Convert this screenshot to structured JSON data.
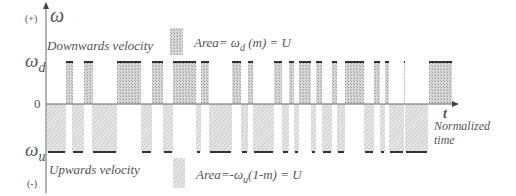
{
  "axis": {
    "y_symbol": "ω",
    "plus_label": "(+)",
    "minus_label": "(-)",
    "zero_label": "0",
    "omega_d_label": "ω",
    "omega_d_sub": "d",
    "omega_u_label": "ω",
    "omega_u_sub": "u",
    "t_label": "t",
    "x_label_line1": "Normalized",
    "x_label_line2": "time"
  },
  "labels": {
    "downwards": "Downwards velocity",
    "upwards": "Upwards velocity"
  },
  "legend": {
    "down_text": "Area=  ω",
    "down_sub": "d",
    "down_tail": " (m) = U",
    "up_text": "Area=-ω",
    "up_sub": "u",
    "up_tail": "(1-m) = U"
  },
  "colors": {
    "up_fill": "#c9c9c9",
    "down_fill": "#dcdcdc",
    "level_line": "#333333",
    "axis": "#555555"
  },
  "pulses": {
    "positive": [
      [
        66,
        73
      ],
      [
        84,
        93
      ],
      [
        117,
        141
      ],
      [
        152,
        163
      ],
      [
        173,
        196
      ],
      [
        201,
        209
      ],
      [
        232,
        241
      ],
      [
        248,
        253
      ],
      [
        274,
        282
      ],
      [
        289,
        294
      ],
      [
        299,
        311
      ],
      [
        316,
        322
      ],
      [
        332,
        337
      ],
      [
        345,
        364
      ],
      [
        374,
        380
      ],
      [
        385,
        389
      ],
      [
        404,
        405
      ],
      [
        429,
        452
      ]
    ],
    "negative": [
      [
        47,
        66
      ],
      [
        72,
        84
      ],
      [
        92,
        117
      ],
      [
        141,
        152
      ],
      [
        163,
        173
      ],
      [
        196,
        201
      ],
      [
        209,
        232
      ],
      [
        241,
        248
      ],
      [
        253,
        274
      ],
      [
        282,
        289
      ],
      [
        294,
        299
      ],
      [
        311,
        316
      ],
      [
        322,
        332
      ],
      [
        337,
        345
      ],
      [
        364,
        374
      ],
      [
        380,
        385
      ],
      [
        389,
        404
      ],
      [
        405,
        428
      ]
    ]
  }
}
